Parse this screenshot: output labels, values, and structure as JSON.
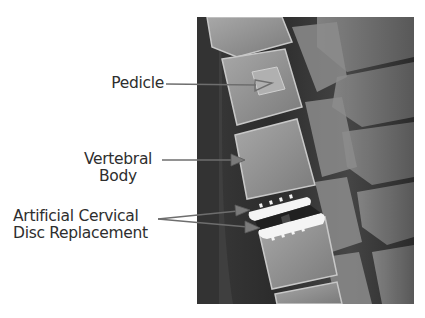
{
  "figure": {
    "labels": [
      {
        "id": "pedicle",
        "lines": [
          "Pedicle"
        ]
      },
      {
        "id": "vertebral-body",
        "lines": [
          "Vertebral",
          "Body"
        ]
      },
      {
        "id": "disc-replacement",
        "lines": [
          "Artificial Cervical",
          "Disc Replacement"
        ]
      }
    ]
  },
  "labels": {
    "pedicle": "Pedicle",
    "vertebral_body_line1": "Vertebral",
    "vertebral_body_line2": "Body",
    "disc_line1": "Artificial Cervical",
    "disc_line2": "Disc Replacement"
  },
  "colors": {
    "text": "#2e2e2e",
    "arrow": "#6e6e6e",
    "xray_dark": "#2a2a2a",
    "xray_bone": "#9a9a9a",
    "implant": "#f4f4f4"
  }
}
